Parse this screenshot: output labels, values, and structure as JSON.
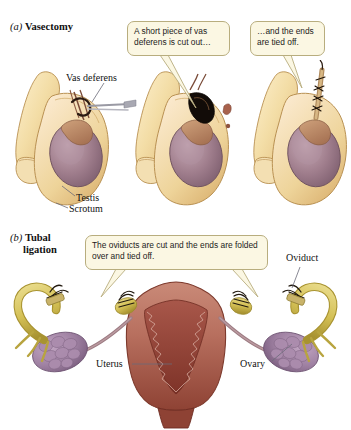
{
  "figure": {
    "background": "#ffffff"
  },
  "sections": [
    {
      "enumerator": "(a)",
      "name": "Vasectomy",
      "name_line2": ""
    },
    {
      "enumerator": "(b)",
      "name": "Tubal",
      "name_line2": "ligation"
    }
  ],
  "callouts": [
    {
      "id": "callout-1",
      "text": "A short piece of vas deferens is cut out…"
    },
    {
      "id": "callout-2",
      "text": "…and the ends are tied off."
    },
    {
      "id": "callout-3",
      "text": "The oviducts are cut and the ends are folded over and tied off."
    }
  ],
  "annotations": [
    {
      "id": "anno-vas",
      "label": "Vas deferens"
    },
    {
      "id": "anno-testis",
      "label": "Testis"
    },
    {
      "id": "anno-scrotum",
      "label": "Scrotum"
    },
    {
      "id": "anno-oviduct",
      "label": "Oviduct"
    },
    {
      "id": "anno-uterus",
      "label": "Uterus"
    },
    {
      "id": "anno-ovary",
      "label": "Ovary"
    }
  ],
  "colors": {
    "callout_fill": "#fbf7e3",
    "callout_border": "#b8ad7e",
    "skin_light": "#f6e3b4",
    "skin_mid": "#e9cd8d",
    "skin_shadow": "#d4ae68",
    "testis": "#9e7d93",
    "testis_light": "#b99aa8",
    "epididymis": "#b98a6a",
    "uterus": "#c27f70",
    "uterus_dark": "#8e4034",
    "uterus_inner": "#a85e50",
    "ovary": "#9c7b9e",
    "ovary_light": "#b79ab8",
    "oviduct": "#d8c86a",
    "oviduct_dark": "#b8a43f",
    "tube": "#9c7b82",
    "leader_line": "#6b6b78",
    "incision": "#1a1a1a"
  },
  "panels": {
    "vasectomy": [
      {
        "index": 1,
        "state": "vas deferens exposed through incision"
      },
      {
        "index": 2,
        "state": "segment of vas deferens cut out"
      },
      {
        "index": 3,
        "state": "cut ends tied off"
      }
    ],
    "tubal_ligation": [
      {
        "index": 1,
        "state": "oviducts cut, ends folded over and tied off"
      }
    ]
  }
}
